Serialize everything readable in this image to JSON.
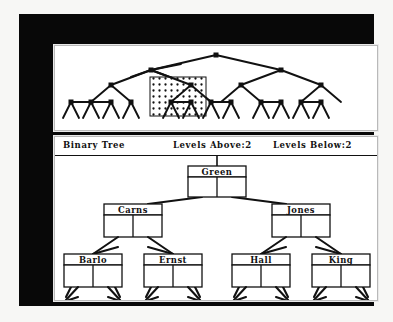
{
  "app": {
    "title": "Binary Tree",
    "frame_color": "#080808",
    "panel_background": "#ffffff",
    "page_background": "#f7f7f5",
    "ink_color": "#111111"
  },
  "overview": {
    "name": "tree-overview-map",
    "description": "full binary tree overview with stippled selection region",
    "depth_levels": 5,
    "leaf_count": 16,
    "node_marker": "square-dot",
    "selection": {
      "name": "selection-highlight",
      "fill_pattern": "stipple-dots",
      "x": 95,
      "y": 31,
      "width": 56,
      "height": 39
    }
  },
  "header": {
    "title": "Binary Tree",
    "levels_above_label": "Levels Above:2",
    "levels_below_label": "Levels Below:2"
  },
  "tree": {
    "root": {
      "label": "Green",
      "cx": 162,
      "cy": 16
    },
    "level2": [
      {
        "label": "Carns",
        "cx": 78,
        "cy": 53
      },
      {
        "label": "Jones",
        "cx": 246,
        "cy": 53
      }
    ],
    "level3": [
      {
        "label": "Barlo",
        "cx": 38,
        "cy": 103
      },
      {
        "label": "Ernst",
        "cx": 118,
        "cy": 103
      },
      {
        "label": "Hall",
        "cx": 206,
        "cy": 103
      },
      {
        "label": "King",
        "cx": 286,
        "cy": 103
      }
    ],
    "node_box": {
      "width": 58,
      "label_height": 11,
      "cell_height": 14
    }
  }
}
